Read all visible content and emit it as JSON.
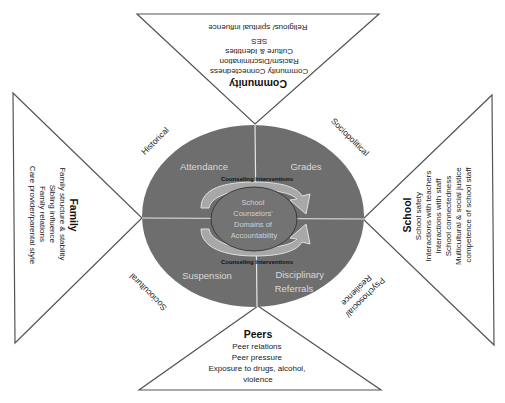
{
  "diagram": {
    "center": {
      "label_lines": [
        "School",
        "Counselors'",
        "Domains of",
        "Accountability"
      ]
    },
    "quadrants": [
      {
        "id": "attendance",
        "label_lines": [
          "Attendance"
        ]
      },
      {
        "id": "grades",
        "label_lines": [
          "Grades"
        ]
      },
      {
        "id": "suspension",
        "label_lines": [
          "Suspension"
        ]
      },
      {
        "id": "disciplinary-referrals",
        "label_lines": [
          "Disciplinary",
          "Referrals"
        ]
      }
    ],
    "interventions": {
      "top": "Counseling Interventions",
      "bottom": "Counseling Interventions"
    },
    "contexts": {
      "top_left": "Historical",
      "top_right": "Sociopolitical",
      "bottom_left": "Sociocultural",
      "bottom_right_lines": [
        "Psychosocial/",
        "Resilience"
      ]
    },
    "triangles": {
      "community": {
        "title": "Community",
        "items": [
          "Community Connectedness",
          "Racism/Discrimination",
          "Culture & Identities",
          "SES",
          "Religious/ spiritual influence"
        ]
      },
      "family": {
        "title": "Family",
        "items": [
          "Family structure & stability",
          "Sibling influence",
          "Family relations",
          "Care provider/parental style"
        ]
      },
      "school": {
        "title": "School",
        "items": [
          "School safety",
          "Interactions with teachers",
          "Interactions with staff",
          "School connectedness",
          "Multicultural & social justice",
          "competence of school staff"
        ]
      },
      "peers": {
        "title": "Peers",
        "items": [
          "Peer relations",
          "Peer pressure",
          "Exposure to drugs, alcohol,",
          "violence"
        ]
      }
    },
    "colors": {
      "ellipse_fill": "#6e6e6e",
      "inner_ellipse_fill": "#737373",
      "arrow_fill": "#a8a8a8",
      "line": "#555555"
    }
  }
}
